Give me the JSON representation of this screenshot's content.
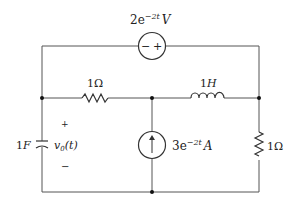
{
  "diagram": {
    "type": "circuit",
    "components": {
      "voltage_source": {
        "value": "2e",
        "exp": "−2t",
        "unit": "V",
        "minus": "−",
        "plus": "+"
      },
      "resistor_top": {
        "value": "1Ω"
      },
      "inductor": {
        "value": "1H"
      },
      "capacitor": {
        "value": "1F"
      },
      "voltage_label": {
        "text": "v",
        "sub": "0",
        "arg": "(t)",
        "plus": "+",
        "minus": "−"
      },
      "current_source": {
        "value": "3e",
        "exp": "−2t",
        "unit": "A"
      },
      "resistor_right": {
        "value": "1Ω"
      }
    },
    "colors": {
      "wire": "#555555",
      "node": "#111111"
    }
  }
}
